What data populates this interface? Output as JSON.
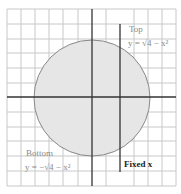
{
  "diagram": {
    "region_fill": "#e6e6e6",
    "circle_stroke": "#888888",
    "grid_color": "#c8c8c8",
    "axis_color": "#333333",
    "labels": {
      "top_title": "Top",
      "top_equation": "y = √4 − x²",
      "bottom_title": "Bottom",
      "bottom_equation": "y = −√4 − x²",
      "fixed_x": "Fixed x"
    }
  }
}
